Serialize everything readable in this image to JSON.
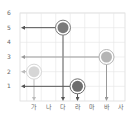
{
  "chart_data": {
    "type": "scatter",
    "title": "",
    "xlabel": "",
    "ylabel": "",
    "categories": [
      "가",
      "나",
      "다",
      "라",
      "마",
      "바",
      "사"
    ],
    "y_ticks": [
      1,
      2,
      3,
      4,
      5,
      6
    ],
    "ylim": [
      0,
      6
    ],
    "grid": true,
    "legend": "none",
    "points": [
      {
        "x": "다",
        "y": 5,
        "color": "#7a7a7a",
        "arrow_color": "#555555"
      },
      {
        "x": "바",
        "y": 3,
        "color": "#b5b5b5",
        "arrow_color": "#999999"
      },
      {
        "x": "가",
        "y": 2,
        "color": "#d6d6d6",
        "arrow_color": "#bbbbbb"
      },
      {
        "x": "라",
        "y": 1,
        "color": "#6e6e6e",
        "arrow_color": "#555555"
      }
    ]
  }
}
